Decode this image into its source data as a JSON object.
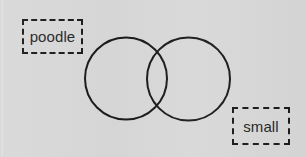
{
  "canvas": {
    "width": 306,
    "height": 157,
    "background_color": "#d8d8d8",
    "stroke_color": "#1a1a1a",
    "text_color": "#262626"
  },
  "diagram": {
    "type": "venn-two-set",
    "circles": [
      {
        "name": "left-circle",
        "cx": 126,
        "cy": 78.5,
        "r": 41,
        "stroke": "#1a1a1a",
        "stroke_width": 2,
        "fill": "none"
      },
      {
        "name": "right-circle",
        "cx": 188.5,
        "cy": 79,
        "r": 41.5,
        "stroke": "#1a1a1a",
        "stroke_width": 2,
        "fill": "none"
      }
    ]
  },
  "labels": [
    {
      "id": "poodle",
      "text": "poodle",
      "border_style": "dashed",
      "border_color": "#1a1a1a",
      "x": 22,
      "y": 19,
      "width": 61,
      "height": 35
    },
    {
      "id": "small",
      "text": "small",
      "border_style": "dashed",
      "border_color": "#1a1a1a",
      "x": 232,
      "y": 107,
      "width": 58,
      "height": 38
    }
  ]
}
